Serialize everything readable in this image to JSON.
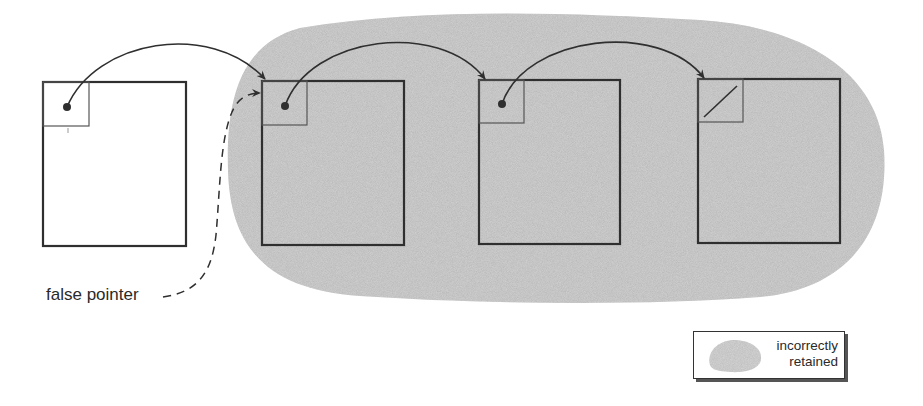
{
  "diagram": {
    "type": "heap-object-graph",
    "colors": {
      "stroke": "#2f2f2f",
      "retained_fill": "#c9c9c9",
      "background": "#ffffff"
    },
    "objects": [
      {
        "id": "root-object",
        "shaded": false,
        "x": 43,
        "y": 82,
        "w": 143,
        "h": 164,
        "field": "pointer"
      },
      {
        "id": "object-1",
        "shaded": true,
        "x": 262,
        "y": 81,
        "w": 142,
        "h": 164,
        "field": "pointer"
      },
      {
        "id": "object-2",
        "shaded": true,
        "x": 479,
        "y": 80,
        "w": 141,
        "h": 164,
        "field": "pointer"
      },
      {
        "id": "object-3",
        "shaded": true,
        "x": 698,
        "y": 79,
        "w": 142,
        "h": 164,
        "field": "null"
      }
    ],
    "edges": [
      {
        "from": "root-object",
        "to": "object-1",
        "style": "solid"
      },
      {
        "from": "object-1",
        "to": "object-2",
        "style": "solid"
      },
      {
        "from": "object-2",
        "to": "object-3",
        "style": "solid"
      },
      {
        "from": "false-pointer",
        "to": "object-1",
        "style": "dashed"
      }
    ]
  },
  "labels": {
    "false_pointer": "false pointer"
  },
  "legend": {
    "line1": "incorrectly",
    "line2": "retained",
    "swatch": "shaded-blob"
  }
}
